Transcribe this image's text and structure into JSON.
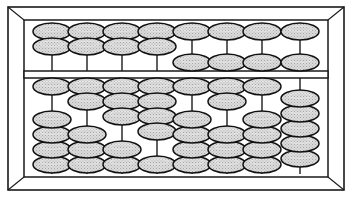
{
  "figure": {
    "device_name": "abacus",
    "rod_count": 8,
    "deck_count": 2
  },
  "colors": {
    "background": "#ffffff",
    "frame_stroke": "#1a1a1a",
    "rod_stroke": "#2b2b2b",
    "bead_fill": "#d9d9d9",
    "bead_stroke": "#111111",
    "beam_fill": "#ffffff"
  },
  "geometry": {
    "width": 352,
    "height": 197,
    "outer_frame": {
      "x": 8,
      "y": 7,
      "w": 336,
      "h": 183
    },
    "inner_frame": {
      "x": 24,
      "y": 20,
      "w": 304,
      "h": 157
    },
    "bevel_inset": 16,
    "upper_deck": {
      "x": 26,
      "y": 22,
      "w": 300,
      "h": 50
    },
    "beam": {
      "x": 26,
      "y": 72,
      "w": 300,
      "h": 5
    },
    "lower_deck": {
      "x": 26,
      "y": 77,
      "w": 300,
      "h": 98
    },
    "rod_x": [
      52,
      87,
      122,
      157,
      192,
      227,
      262,
      300
    ],
    "bead_rx": 19,
    "bead_ry": 8.5,
    "bead_pitch": 15
  },
  "upper_deck": {
    "name": "upper-deck",
    "bead_capacity_per_rod": 2,
    "rods": [
      {
        "index": 1,
        "name": "upper-rod-1",
        "beads_top": 2,
        "beads_bottom": 0,
        "value": 0
      },
      {
        "index": 2,
        "name": "upper-rod-2",
        "beads_top": 2,
        "beads_bottom": 0,
        "value": 0
      },
      {
        "index": 3,
        "name": "upper-rod-3",
        "beads_top": 2,
        "beads_bottom": 0,
        "value": 0
      },
      {
        "index": 4,
        "name": "upper-rod-4",
        "beads_top": 2,
        "beads_bottom": 0,
        "value": 0
      },
      {
        "index": 5,
        "name": "upper-rod-5",
        "beads_top": 1,
        "beads_bottom": 1,
        "value": 5
      },
      {
        "index": 6,
        "name": "upper-rod-6",
        "beads_top": 1,
        "beads_bottom": 1,
        "value": 5
      },
      {
        "index": 7,
        "name": "upper-rod-7",
        "beads_top": 1,
        "beads_bottom": 1,
        "value": 5
      },
      {
        "index": 8,
        "name": "upper-rod-8",
        "beads_top": 1,
        "beads_bottom": 1,
        "value": 5
      }
    ]
  },
  "lower_deck": {
    "name": "lower-deck",
    "bead_capacity_per_rod": 5,
    "rods": [
      {
        "index": 1,
        "name": "lower-rod-1",
        "beads_top": 1,
        "beads_bottom": 4,
        "value": 1
      },
      {
        "index": 2,
        "name": "lower-rod-2",
        "beads_top": 2,
        "beads_bottom": 3,
        "value": 2
      },
      {
        "index": 3,
        "name": "lower-rod-3",
        "beads_top": 3,
        "beads_bottom": 2,
        "value": 3
      },
      {
        "index": 4,
        "name": "lower-rod-4",
        "beads_top": 4,
        "beads_bottom": 1,
        "value": 4
      },
      {
        "index": 5,
        "name": "lower-rod-5",
        "beads_top": 1,
        "beads_bottom": 4,
        "value": 1
      },
      {
        "index": 6,
        "name": "lower-rod-6",
        "beads_top": 2,
        "beads_bottom": 3,
        "value": 2
      },
      {
        "index": 7,
        "name": "lower-rod-7",
        "beads_top": 1,
        "beads_bottom": 4,
        "value": 1
      },
      {
        "index": 8,
        "name": "lower-rod-8",
        "beads_top": 0,
        "beads_bottom": 5,
        "value": 0
      }
    ]
  }
}
